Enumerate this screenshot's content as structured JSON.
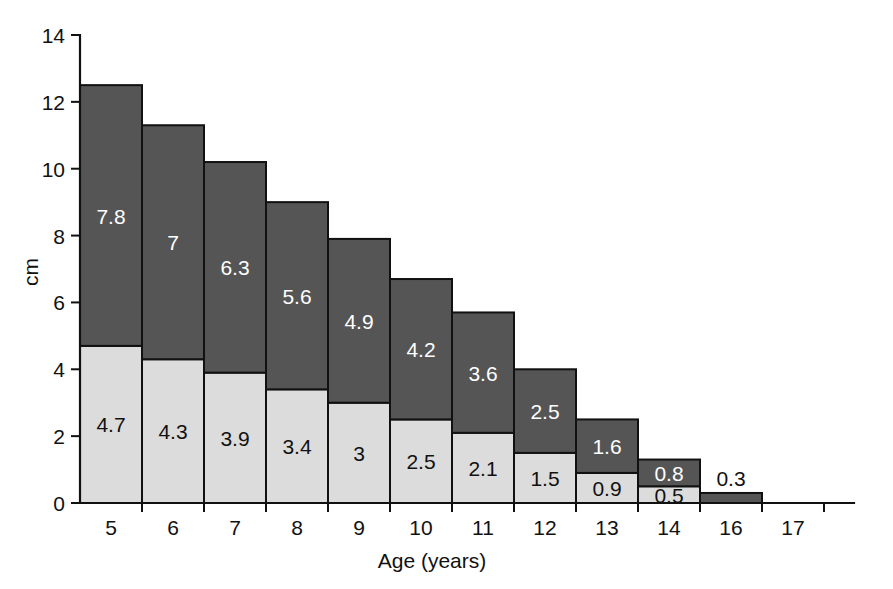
{
  "chart_data": {
    "type": "bar",
    "title": "",
    "subtitle": "",
    "stacked": true,
    "xlabel": "Age (years)",
    "ylabel": "cm",
    "categories": [
      "5",
      "6",
      "7",
      "8",
      "9",
      "10",
      "11",
      "12",
      "13",
      "14",
      "16",
      "17"
    ],
    "yticks": [
      "0",
      "2",
      "4",
      "6",
      "8",
      "10",
      "12",
      "14"
    ],
    "ylim": [
      0,
      14
    ],
    "grid": false,
    "legend": "none",
    "series": [
      {
        "name": "lower-segment",
        "color": "#dcdcdc",
        "values": [
          4.7,
          4.3,
          3.9,
          3.4,
          3,
          2.5,
          2.1,
          1.5,
          0.9,
          0.5,
          0,
          0
        ],
        "labels": [
          "4.7",
          "4.3",
          "3.9",
          "3.4",
          "3",
          "2.5",
          "2.1",
          "1.5",
          "0.9",
          "0.5",
          "",
          ""
        ]
      },
      {
        "name": "upper-segment",
        "color": "#555555",
        "values": [
          7.8,
          7,
          6.3,
          5.6,
          4.9,
          4.2,
          3.6,
          2.5,
          1.6,
          0.8,
          0.3,
          0
        ],
        "labels": [
          "7.8",
          "7",
          "6.3",
          "5.6",
          "4.9",
          "4.2",
          "3.6",
          "2.5",
          "1.6",
          "0.8",
          "0.3",
          ""
        ]
      }
    ],
    "totals": [
      12.5,
      11.3,
      10.2,
      9.0,
      7.9,
      6.7,
      5.7,
      4.0,
      2.5,
      1.3,
      0.3,
      0
    ]
  },
  "colors": {
    "lower_fill": "#dcdcdc",
    "upper_fill": "#555555",
    "outline": "#111111",
    "background": "#ffffff",
    "label_on_dark": "#ffffff",
    "label_on_light": "#111111"
  }
}
